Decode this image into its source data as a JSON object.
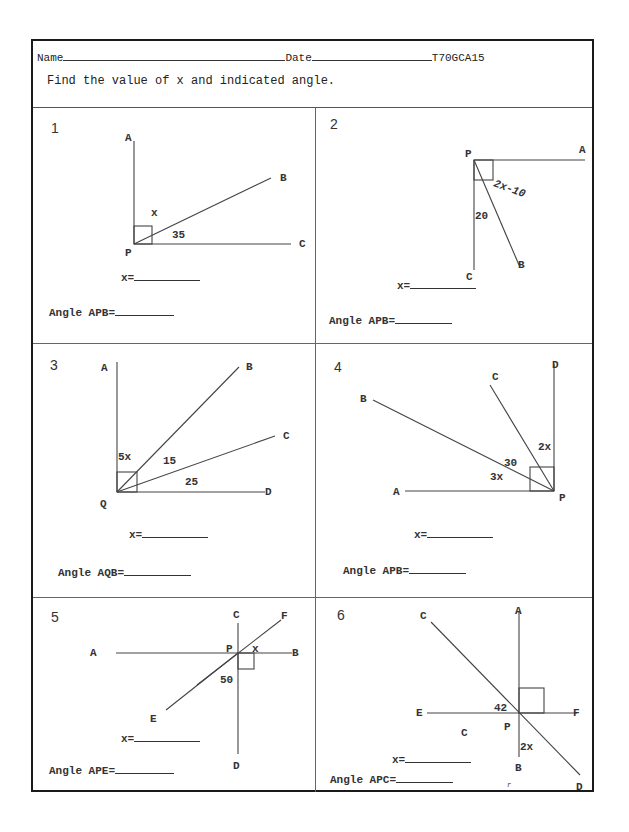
{
  "header": {
    "name_label": "Name",
    "date_label": "Date",
    "worksheet_code": "T70GCA15",
    "instruction": "Find the value of x and indicated angle."
  },
  "problems": [
    {
      "number": "1",
      "points": {
        "A": "A",
        "B": "B",
        "C": "C",
        "P": "P"
      },
      "given": {
        "unknown": "x",
        "angle": "35"
      },
      "x_prompt": "x=",
      "angle_prompt": "Angle APB="
    },
    {
      "number": "2",
      "points": {
        "A": "A",
        "B": "B",
        "C": "C",
        "P": "P"
      },
      "given": {
        "expr": "2x-10",
        "angle": "20"
      },
      "x_prompt": "x=",
      "angle_prompt": "Angle APB="
    },
    {
      "number": "3",
      "points": {
        "A": "A",
        "B": "B",
        "C": "C",
        "D": "D",
        "Q": "Q"
      },
      "given": {
        "expr": "5x",
        "angle1": "15",
        "angle2": "25"
      },
      "x_prompt": "x=",
      "angle_prompt": "Angle AQB="
    },
    {
      "number": "4",
      "points": {
        "A": "A",
        "B": "B",
        "C": "C",
        "D": "D",
        "P": "P"
      },
      "given": {
        "expr1": "2x",
        "angle": "30",
        "expr2": "3x"
      },
      "x_prompt": "x=",
      "angle_prompt": "Angle APB="
    },
    {
      "number": "5",
      "points": {
        "A": "A",
        "B": "B",
        "C": "C",
        "D": "D",
        "E": "E",
        "F": "F",
        "P": "P"
      },
      "given": {
        "unknown": "x",
        "angle": "50"
      },
      "x_prompt": "x=",
      "angle_prompt": "Angle APE="
    },
    {
      "number": "6",
      "points": {
        "A": "A",
        "B": "B",
        "C": "C",
        "D": "D",
        "E": "E",
        "F": "F",
        "P": "P",
        "C_region": "C"
      },
      "given": {
        "angle": "42",
        "expr": "2x"
      },
      "x_prompt": "x=",
      "angle_prompt": "Angle APC=",
      "stray_mark": "r"
    }
  ]
}
